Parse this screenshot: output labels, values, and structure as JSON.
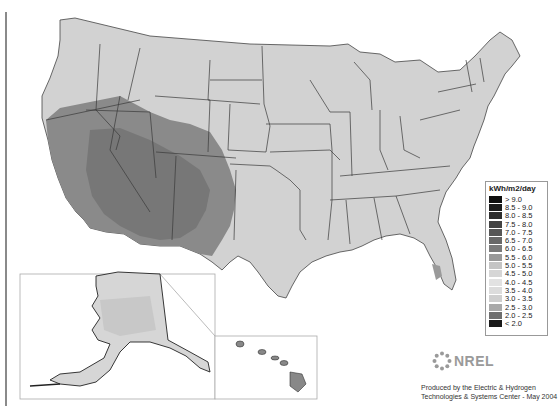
{
  "map": {
    "subject": "Solar radiation, kWh/m2/day, United States",
    "insets": [
      "Alaska",
      "Hawaii"
    ]
  },
  "legend": {
    "title": "kWh/m2/day",
    "items": [
      {
        "label": "> 9.0",
        "color": "#0f0f0f"
      },
      {
        "label": "8.5 - 9.0",
        "color": "#1c1c1c"
      },
      {
        "label": "8.0 - 8.5",
        "color": "#2e2e2e"
      },
      {
        "label": "7.5 - 8.0",
        "color": "#434343"
      },
      {
        "label": "7.0 - 7.5",
        "color": "#565656"
      },
      {
        "label": "6.5 - 7.0",
        "color": "#686868"
      },
      {
        "label": "6.0 - 6.5",
        "color": "#7a7a7a"
      },
      {
        "label": "5.5 - 6.0",
        "color": "#999999"
      },
      {
        "label": "5.0 - 5.5",
        "color": "#c4c4c4"
      },
      {
        "label": "4.5 - 5.0",
        "color": "#d6d6d6"
      },
      {
        "label": "4.0 - 4.5",
        "color": "#e2e2e2"
      },
      {
        "label": "3.5 - 4.0",
        "color": "#dcdcdc"
      },
      {
        "label": "3.0 - 3.5",
        "color": "#cfcfcf"
      },
      {
        "label": "2.5 - 3.0",
        "color": "#a9a9a9"
      },
      {
        "label": "2.0 - 2.5",
        "color": "#6e6e6e"
      },
      {
        "label": "< 2.0",
        "color": "#1a1a1a"
      }
    ]
  },
  "logo": {
    "text": "NREL"
  },
  "credit": {
    "line1": "Produced by the Electric & Hydrogen",
    "line2": "Technologies & Systems Center - May 2004"
  }
}
